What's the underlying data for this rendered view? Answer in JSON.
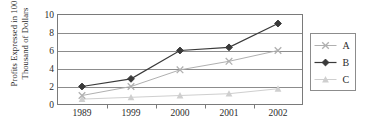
{
  "chart_data": {
    "type": "line",
    "title": "",
    "xlabel": "",
    "ylabel": "Profits Expressed in 100 Thousand of Dollars",
    "categories": [
      "1989",
      "1999",
      "2000",
      "2001",
      "2002"
    ],
    "ylim": [
      0,
      10
    ],
    "yticks": [
      0,
      2,
      4,
      6,
      8,
      10
    ],
    "ytick_labels": [
      "0",
      "2",
      "4",
      "6",
      "8",
      "10"
    ],
    "grid": true,
    "grid_axis": "y",
    "legend_position": "right",
    "series": [
      {
        "name": "A",
        "marker": "x-icon",
        "color": "#b0b0b0",
        "values": [
          1.0,
          2.0,
          3.85,
          4.8,
          6.0
        ]
      },
      {
        "name": "B",
        "marker": "diamond-icon",
        "color": "#3a3a3a",
        "values": [
          2.0,
          2.85,
          6.0,
          6.35,
          9.0
        ]
      },
      {
        "name": "C",
        "marker": "triangle-icon",
        "color": "#cfcfcf",
        "values": [
          0.6,
          0.8,
          1.0,
          1.2,
          1.75
        ]
      }
    ]
  },
  "ylabel_lines": {
    "line1": "Profits Expressed in 100",
    "line2": "Thousand of Dollars"
  },
  "legend": {
    "items": [
      {
        "label": "A"
      },
      {
        "label": "B"
      },
      {
        "label": "C"
      }
    ]
  },
  "colors": {
    "plot_border": "#7a7a7a",
    "gridline": "#8c8c8c",
    "background": "#ffffff",
    "text": "#2b2b2b",
    "legend_border": "#8c8c8c"
  }
}
